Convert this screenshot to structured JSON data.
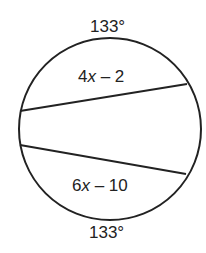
{
  "diagram": {
    "top_arc_label": "133°",
    "bottom_arc_label": "133°",
    "upper_chord_label": {
      "coef": "4",
      "var": "x",
      "rest": " – 2"
    },
    "lower_chord_label": {
      "coef": "6",
      "var": "x",
      "rest": " – 10"
    }
  }
}
